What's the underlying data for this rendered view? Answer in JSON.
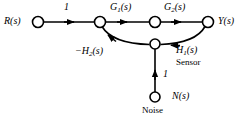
{
  "figure": {
    "type": "signal-flow-graph",
    "title": "",
    "stroke_color": "#000000",
    "background_color": "#ffffff"
  },
  "nodes": [
    {
      "id": "R",
      "label": "R(s)",
      "x": 38,
      "y": 22,
      "r": 5.5
    },
    {
      "id": "sum",
      "label": "",
      "x": 100,
      "y": 22,
      "r": 5.5
    },
    {
      "id": "mid",
      "label": "",
      "x": 155,
      "y": 22,
      "r": 5.5
    },
    {
      "id": "Y",
      "label": "Y(s)",
      "x": 208,
      "y": 22,
      "r": 5.5
    },
    {
      "id": "junction",
      "label": "",
      "x": 155,
      "y": 44,
      "r": 5.0
    },
    {
      "id": "N",
      "label": "N(s)",
      "x": 155,
      "y": 97,
      "r": 5.0
    }
  ],
  "labels": {
    "input": "R(s)",
    "output": "Y(s)",
    "noise_node": "N(s)",
    "noise_caption": "Noise",
    "sensor_caption": "Sensor",
    "gain_input": "1",
    "gain_noise": "1",
    "branch_G1": "G",
    "branch_G1_sub": "1",
    "branch_G1_arg": "(s)",
    "branch_G2": "G",
    "branch_G2_sub": "2",
    "branch_G2_arg": "(s)",
    "branch_H1": "H",
    "branch_H1_sub": "1",
    "branch_H1_arg": "(s)",
    "branch_H2": "−H",
    "branch_H2_sub": "2",
    "branch_H2_arg": "(s)"
  },
  "edges": [
    {
      "from": "R",
      "to": "sum",
      "gain": "1",
      "shape": "straight",
      "direction": "right"
    },
    {
      "from": "sum",
      "to": "mid",
      "gain": "G1(s)",
      "shape": "straight",
      "direction": "right"
    },
    {
      "from": "mid",
      "to": "Y",
      "gain": "G2(s)",
      "shape": "straight",
      "direction": "right"
    },
    {
      "from": "Y",
      "to": "junction",
      "gain": "H1(s)",
      "shape": "curve",
      "direction": "down-left"
    },
    {
      "from": "junction",
      "to": "sum",
      "gain": "-H2(s)",
      "shape": "curve",
      "direction": "up-left"
    },
    {
      "from": "N",
      "to": "junction",
      "gain": "1",
      "shape": "straight",
      "direction": "up"
    }
  ]
}
